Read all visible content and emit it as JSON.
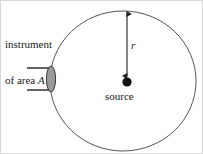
{
  "figure": {
    "width": 203,
    "height": 154,
    "background_color": "#ffffff",
    "border_color": "#d8d8d8"
  },
  "labels": {
    "instrument_line1": "instrument",
    "instrument_line2_prefix": "of area ",
    "instrument_area_symbol": "A",
    "radius_symbol": "r",
    "source": "source"
  },
  "shapes": {
    "sphere": {
      "name": "spherical-surface",
      "center_x": 122,
      "center_y": 80,
      "radius_x": 73,
      "radius_y": 70,
      "stroke": "#555555",
      "stroke_width": 1,
      "fill": "none"
    },
    "source_point": {
      "name": "source-point",
      "center_x": 126,
      "center_y": 81,
      "radius": 4.5,
      "fill": "#111111"
    },
    "radius_arrow": {
      "name": "radius-double-arrow",
      "x": 126,
      "y_top": 12,
      "y_bottom": 76,
      "stroke": "#333333",
      "stroke_width": 1.2,
      "heads": "both"
    },
    "detector": {
      "name": "detector-aperture",
      "ellipse_cx": 50,
      "ellipse_cy": 78,
      "ellipse_rx": 4.5,
      "ellipse_ry": 13,
      "fill": "#9a9a9a",
      "stroke": "#3a3a3a",
      "line_top_y": 67,
      "line_bottom_y": 89,
      "line_x_start": 26,
      "line_x_end": 49,
      "line_stroke": "#222222"
    }
  },
  "colors": {
    "ink": "#1a1a1a",
    "sphere_stroke": "#555555",
    "detector_fill": "#9a9a9a",
    "source_fill": "#111111"
  }
}
